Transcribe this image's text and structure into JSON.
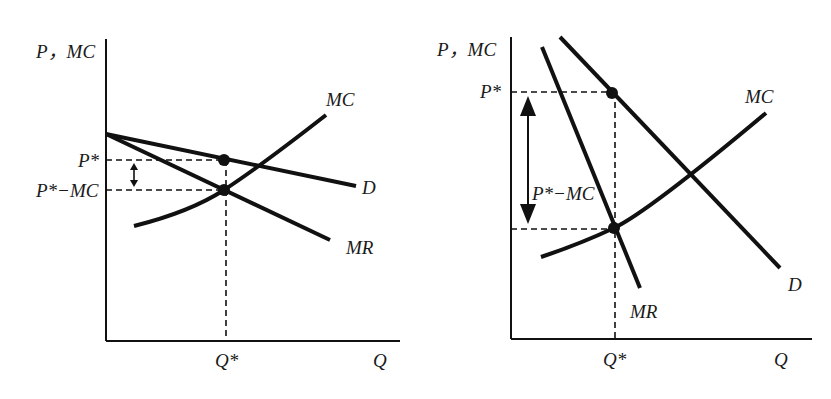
{
  "figure": {
    "left_panel": {
      "axis_y_label": "P，MC",
      "axis_x_label": "Q",
      "price_label": "P*",
      "markup_label": "P*−MC",
      "quantity_label": "Q*",
      "curve_labels": {
        "mc": "MC",
        "d": "D",
        "mr": "MR"
      },
      "description": "Elastic (flat) demand: small gap between P* and MC"
    },
    "right_panel": {
      "axis_y_label": "P，MC",
      "axis_x_label": "Q",
      "price_label": "P*",
      "markup_label": "P*−MC",
      "quantity_label": "Q*",
      "curve_labels": {
        "mc": "MC",
        "d": "D",
        "mr": "MR"
      },
      "description": "Inelastic (steep) demand: large gap between P* and MC"
    },
    "caption": "",
    "colors": {
      "ink": "#111111",
      "background": "#ffffff"
    }
  }
}
